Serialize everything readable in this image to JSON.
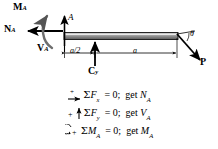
{
  "figure": {
    "type": "free-body-diagram",
    "beam": {
      "color_dark": "#6b6b6b",
      "color_light": "#d8d8d8",
      "outline": "#1a1a1a"
    },
    "labels": {
      "moment_reaction": "M",
      "moment_reaction_sub": "A",
      "normal_reaction": "N",
      "normal_reaction_sub": "A",
      "shear_reaction": "V",
      "shear_reaction_sub": "A",
      "point_a": "A",
      "pin_force": "C",
      "pin_force_sub": "y",
      "applied_load": "P",
      "angle": "θ",
      "dim_left": "a/2",
      "dim_right": "a"
    }
  },
  "equations": [
    {
      "id": "sum-fx",
      "prefix_sign": "+",
      "prefix_arrow": "right",
      "sigma": "Σ",
      "quantity": "F",
      "quantity_sub": "x",
      "equals": "= 0;",
      "result_verb": "get",
      "result": "N",
      "result_sub": "A"
    },
    {
      "id": "sum-fy",
      "prefix_sign": "+",
      "prefix_arrow": "up",
      "sigma": "Σ",
      "quantity": "F",
      "quantity_sub": "y",
      "equals": "= 0;",
      "result_verb": "get",
      "result": "V",
      "result_sub": "A"
    },
    {
      "id": "sum-ma",
      "prefix_sign": "+",
      "prefix_arrow": "ccw",
      "sigma": "Σ",
      "quantity": "M",
      "quantity_sub": "A",
      "equals": "= 0;",
      "result_verb": "get",
      "result": "M",
      "result_sub": "A"
    }
  ]
}
